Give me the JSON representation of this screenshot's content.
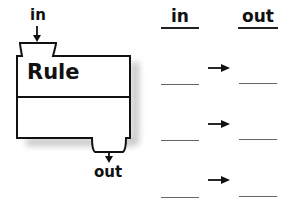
{
  "machine": {
    "input_label": "in",
    "rule_label": "Rule",
    "output_label": "out"
  },
  "table": {
    "headers": {
      "in": "in",
      "out": "out"
    },
    "rows": [
      {
        "in": "",
        "out": ""
      },
      {
        "in": "",
        "out": ""
      },
      {
        "in": "",
        "out": ""
      }
    ],
    "arrow_icon": "right-arrow"
  },
  "colors": {
    "stroke": "#111111",
    "shadow": "#b8b8b8",
    "blank_line": "#666666"
  }
}
